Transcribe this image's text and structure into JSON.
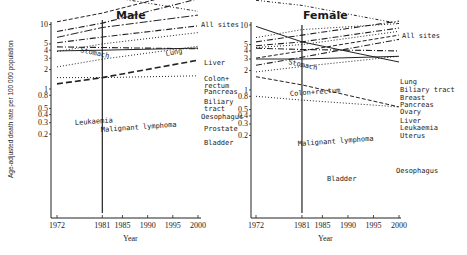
{
  "chart_data": [
    {
      "type": "line",
      "title": "Male",
      "xlabel": "Year",
      "ylabel": "Age-adjusted death rate per 100 000 population",
      "yscale": "log",
      "ylim": [
        0.12,
        110
      ],
      "xlim": [
        1972,
        2000
      ],
      "x_ticks": [
        1972,
        1981,
        1985,
        1990,
        1995,
        2000
      ],
      "y_ticks": [
        "100",
        "80",
        "50",
        "40",
        "10",
        "5",
        "4",
        "3",
        "2",
        "1",
        "0.8",
        "0.5",
        "0.4",
        "0.3",
        "0.2"
      ],
      "y_tick_values": [
        100,
        80,
        50,
        40,
        10,
        5,
        4,
        3,
        2,
        1,
        0.8,
        0.5,
        0.4,
        0.3,
        0.2
      ],
      "grid": false,
      "annotations": [
        {
          "type": "vertical-line",
          "x": 1981
        }
      ],
      "x": [
        1972,
        1981,
        2000
      ],
      "series": [
        {
          "name": "All sites",
          "values": [
            91,
            95,
            100
          ],
          "style": "dashdot",
          "label_pos": "right"
        },
        {
          "name": "Stomach",
          "values": [
            40,
            28,
            16
          ],
          "style": "dashdot-dotted",
          "label_pos": "inline"
        },
        {
          "name": "Lung",
          "values": [
            11,
            15,
            36
          ],
          "style": "dashed",
          "label_pos": "inline"
        },
        {
          "name": "Liver",
          "values": [
            7.8,
            10.5,
            25
          ],
          "style": "dashdot",
          "label_pos": "right"
        },
        {
          "name": "Colon+ rectum",
          "values": [
            6.3,
            9,
            14
          ],
          "style": "longdash-dot",
          "label_pos": "right"
        },
        {
          "name": "Pancreas",
          "values": [
            5.2,
            6.4,
            9.5
          ],
          "style": "dashdot",
          "label_pos": "right"
        },
        {
          "name": "Biliary tract",
          "values": [
            3.8,
            5,
            7.5
          ],
          "style": "dotted",
          "label_pos": "right"
        },
        {
          "name": "Oesophagus",
          "values": [
            4.5,
            4.4,
            4.2
          ],
          "style": "dashdot",
          "label_pos": "right"
        },
        {
          "name": "Leukaemia",
          "values": [
            3.9,
            4.0,
            4.3
          ],
          "style": "solid",
          "label_pos": "inline"
        },
        {
          "name": "Malignant lymphoma",
          "values": [
            2.2,
            2.9,
            4.6
          ],
          "style": "dotted",
          "label_pos": "inline"
        },
        {
          "name": "Prostate",
          "values": [
            1.2,
            1.5,
            2.8
          ],
          "style": "longdash",
          "label_pos": "right"
        },
        {
          "name": "Bladder",
          "values": [
            1.5,
            1.5,
            1.6
          ],
          "style": "dotted",
          "label_pos": "right"
        }
      ]
    },
    {
      "type": "line",
      "title": "Female",
      "xlabel": "Year",
      "ylabel": "Age-adjusted death rate per 100 000 population",
      "yscale": "log",
      "ylim": [
        0.12,
        110
      ],
      "xlim": [
        1972,
        2000
      ],
      "x_ticks": [
        1972,
        1981,
        1985,
        1990,
        1995,
        2000
      ],
      "y_ticks": [
        "100",
        "80",
        "50",
        "40",
        "10",
        "5",
        "4",
        "3",
        "2",
        "1",
        "0.8",
        "0.5",
        "0.4",
        "0.3",
        "0.2"
      ],
      "y_tick_values": [
        100,
        80,
        50,
        40,
        10,
        5,
        4,
        3,
        2,
        1,
        0.8,
        0.5,
        0.4,
        0.3,
        0.2
      ],
      "grid": false,
      "annotations": [
        {
          "type": "vertical-line",
          "x": 1981
        }
      ],
      "x": [
        1972,
        1981,
        2000
      ],
      "series": [
        {
          "name": "All sites",
          "values": [
            80,
            76,
            70
          ],
          "style": "dashdot",
          "label_pos": "right"
        },
        {
          "name": "Stomach",
          "values": [
            24,
            20,
            10.5
          ],
          "style": "dashdot-dotted",
          "label_pos": "inline"
        },
        {
          "name": "Lung",
          "values": [
            5.5,
            7,
            11.5
          ],
          "style": "dashdot",
          "label_pos": "right"
        },
        {
          "name": "Colon+rectum",
          "values": [
            6.4,
            8.5,
            10.5
          ],
          "style": "dotted",
          "label_pos": "inline"
        },
        {
          "name": "Biliary tract",
          "values": [
            4.8,
            5.5,
            9
          ],
          "style": "dashdot",
          "label_pos": "right"
        },
        {
          "name": "Breast",
          "values": [
            4.5,
            5,
            8
          ],
          "style": "dotted",
          "label_pos": "right"
        },
        {
          "name": "Pancreas",
          "values": [
            3.1,
            4,
            7
          ],
          "style": "dashed",
          "label_pos": "right"
        },
        {
          "name": "Ovary",
          "values": [
            2.4,
            3.2,
            6
          ],
          "style": "dashdot",
          "label_pos": "right"
        },
        {
          "name": "Liver",
          "values": [
            4.4,
            4.2,
            4.0
          ],
          "style": "dashdot",
          "label_pos": "right"
        },
        {
          "name": "Leukaemia",
          "values": [
            3.0,
            3.0,
            3.3
          ],
          "style": "solid",
          "label_pos": "right"
        },
        {
          "name": "Uterus",
          "values": [
            9.5,
            5.5,
            2.7
          ],
          "style": "solid",
          "label_pos": "right"
        },
        {
          "name": "Malignant lymphoma",
          "values": [
            1.9,
            2.3,
            3.3
          ],
          "style": "dotted",
          "label_pos": "inline"
        },
        {
          "name": "Oesophagus",
          "values": [
            1.6,
            1.2,
            0.55
          ],
          "style": "dashed",
          "label_pos": "right"
        },
        {
          "name": "Bladder",
          "values": [
            0.8,
            0.7,
            0.55
          ],
          "style": "dotted",
          "label_pos": "inline"
        }
      ]
    }
  ],
  "panels": {
    "male": {
      "title": "Male",
      "xlabel": "Year"
    },
    "female": {
      "title": "Female",
      "xlabel": "Year"
    }
  },
  "ylabel": "Age-adjusted death rate per 100 000 population"
}
